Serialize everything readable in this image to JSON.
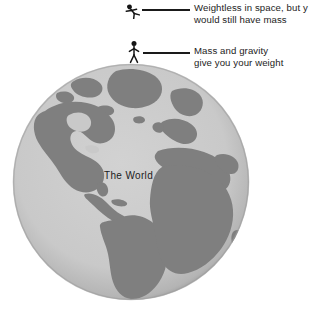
{
  "canvas": {
    "width": 310,
    "height": 311,
    "background_color": "#ffffff"
  },
  "globe": {
    "caption": "The World",
    "ocean_color": "#c9c9c9",
    "land_color": "#7f7f7f",
    "rim_shadow_color": "#9a9a9a",
    "center_x": 131,
    "center_y": 182,
    "radius": 119,
    "projection": "atlantic-centered orthographic",
    "visible_landmasses": [
      "Greenland",
      "North America",
      "South America",
      "Europe",
      "Scandinavia",
      "Africa",
      "Arabian Peninsula"
    ]
  },
  "annotations": [
    {
      "id": "weightless",
      "figure": "floating-astronaut-icon",
      "line1": "Weightless in space, but y",
      "line2": "would still have mass",
      "text_clipped_at_right_edge": true,
      "text_color": "#1c1c1c",
      "line_color": "#1a1a1a"
    },
    {
      "id": "gravity",
      "figure": "standing-person-icon",
      "line1": "Mass and gravity",
      "line2": "give you your weight",
      "text_clipped_at_right_edge": false,
      "text_color": "#1c1c1c",
      "line_color": "#1a1a1a"
    }
  ]
}
